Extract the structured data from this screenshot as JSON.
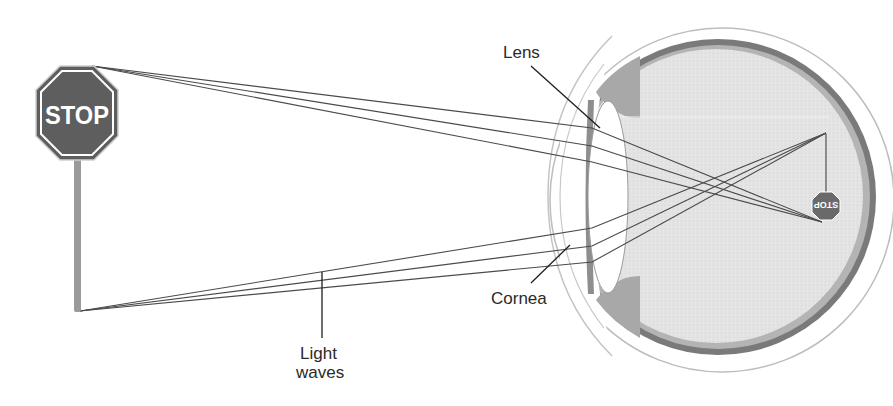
{
  "diagram": {
    "labels": {
      "lens": "Lens",
      "cornea": "Cornea",
      "light_waves_line1": "Light",
      "light_waves_line2": "waves"
    },
    "object": {
      "sign_text": "STOP",
      "inverted_image_text": "STOP"
    },
    "colors": {
      "sign_fill": "#5e5e5e",
      "sign_border": "#ffffff",
      "pole": "#9a9a9a",
      "ray": "#4a4a4a",
      "eye_interior": "#e4e4e4",
      "choroid": "#7a7a7a",
      "sclera_outline": "#bdbdbd",
      "lens_fill": "#ffffff",
      "iris": "#a8a8a8",
      "leader_line": "#1e1e1e",
      "label_text": "#2a2a2a"
    }
  }
}
